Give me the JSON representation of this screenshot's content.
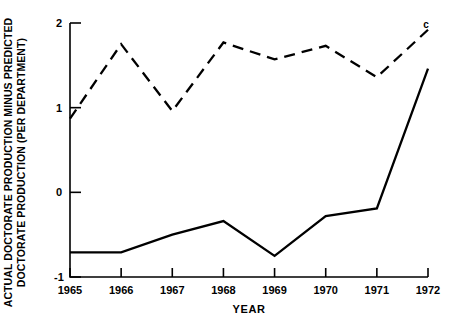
{
  "chart_data": {
    "type": "line",
    "title": "",
    "xlabel": "YEAR",
    "ylabel": "ACTUAL DOCTORATE PRODUCTION MINUS PREDICTED\nDOCTORATE PRODUCTION (PER DEPARTMENT)",
    "x": [
      1965,
      1966,
      1967,
      1968,
      1969,
      1970,
      1971,
      1972
    ],
    "xtick_labels": [
      "1965",
      "1966",
      "1967",
      "1968",
      "1969",
      "1970",
      "1971",
      "1972"
    ],
    "ytick_labels": [
      "2",
      "1",
      "0",
      "-1"
    ],
    "yticks": [
      2,
      1,
      0,
      -1
    ],
    "xlim": [
      1965,
      1972
    ],
    "ylim": [
      -1,
      2
    ],
    "grid": false,
    "legend": "none",
    "series": [
      {
        "name": "dashed-series",
        "style": "dashed",
        "color": "#000000",
        "values": [
          0.87,
          1.75,
          0.96,
          1.77,
          1.57,
          1.73,
          1.36,
          1.92
        ]
      },
      {
        "name": "solid-series",
        "style": "solid",
        "color": "#000000",
        "values": [
          -0.71,
          -0.71,
          -0.5,
          -0.34,
          -0.75,
          -0.28,
          -0.19,
          1.46
        ]
      }
    ],
    "annotations": [
      {
        "text": "c",
        "x": 1972,
        "y": 2.0
      }
    ]
  }
}
